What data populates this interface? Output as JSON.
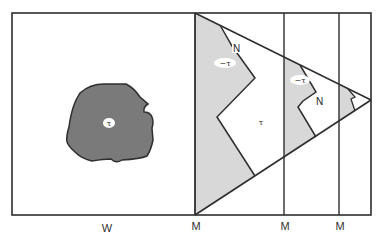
{
  "colors": {
    "background": "#ffffff",
    "stroke": "#2e2e2e",
    "blob_fill": "#7a7a7a",
    "region_fill": "#d8d8d8",
    "label_bubble": "#ffffff"
  },
  "blob": {
    "label": "τ"
  },
  "triangle_regions": [
    {
      "shaded_label": "−τ",
      "boundary_label": "N",
      "inner_label": "τ"
    },
    {
      "shaded_label": "−τ",
      "boundary_label": "N"
    },
    {
      "shaded_label": ""
    }
  ],
  "axis_labels": {
    "w": "W",
    "m1": "M",
    "m2": "M",
    "m3": "M"
  }
}
